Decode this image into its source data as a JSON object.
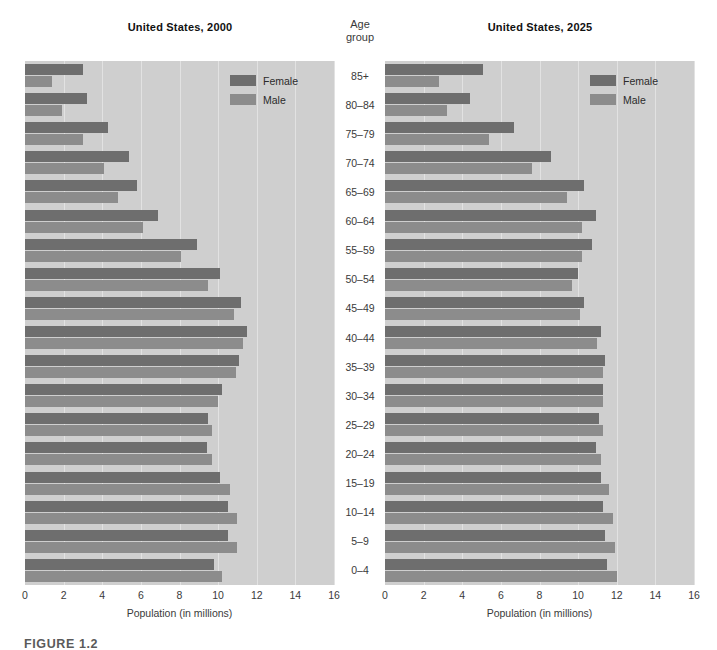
{
  "figure": {
    "caption": "FIGURE 1.2",
    "age_header_line1": "Age",
    "age_header_line2": "group"
  },
  "legend": {
    "female_label": "Female",
    "male_label": "Male",
    "female_color": "#6e6e6e",
    "male_color": "#8c8c8c"
  },
  "axis": {
    "xlabel": "Population (in millions)",
    "ticks": [
      "0",
      "2",
      "4",
      "6",
      "8",
      "10",
      "12",
      "14",
      "16"
    ]
  },
  "chart_data": {
    "type": "bar",
    "xlabel": "Population (in millions)",
    "ylabel": "Age group",
    "xlim": [
      0,
      16
    ],
    "grid": true,
    "legend_position": "top-right",
    "categories": [
      "85+",
      "80-84",
      "75-79",
      "70-74",
      "65-69",
      "60-64",
      "55-59",
      "50-54",
      "45-49",
      "40-44",
      "35-39",
      "30-34",
      "25-29",
      "20-24",
      "15-19",
      "10-14",
      "5-9",
      "0-4"
    ],
    "panels": [
      {
        "title": "United States, 2000",
        "series": [
          {
            "name": "Female",
            "values": [
              3.0,
              3.2,
              4.3,
              5.4,
              5.8,
              6.9,
              8.9,
              10.1,
              11.2,
              11.5,
              11.1,
              10.2,
              9.5,
              9.4,
              10.1,
              10.5,
              10.5,
              9.8
            ]
          },
          {
            "name": "Male",
            "values": [
              1.4,
              1.9,
              3.0,
              4.1,
              4.8,
              6.1,
              8.1,
              9.5,
              10.8,
              11.3,
              10.9,
              10.0,
              9.7,
              9.7,
              10.6,
              11.0,
              11.0,
              10.2
            ]
          }
        ]
      },
      {
        "title": "United States, 2025",
        "series": [
          {
            "name": "Female",
            "values": [
              5.1,
              4.4,
              6.7,
              8.6,
              10.3,
              10.9,
              10.7,
              10.0,
              10.3,
              11.2,
              11.4,
              11.3,
              11.1,
              10.9,
              11.2,
              11.3,
              11.4,
              11.5
            ]
          },
          {
            "name": "Male",
            "values": [
              2.8,
              3.2,
              5.4,
              7.6,
              9.4,
              10.2,
              10.2,
              9.7,
              10.1,
              11.0,
              11.3,
              11.3,
              11.3,
              11.2,
              11.6,
              11.8,
              11.9,
              12.0
            ]
          }
        ]
      }
    ]
  }
}
